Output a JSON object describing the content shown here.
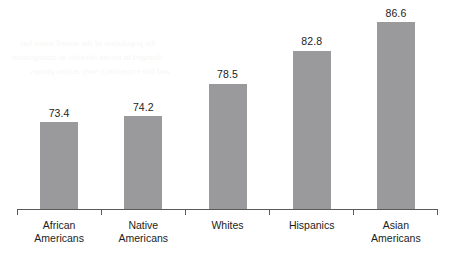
{
  "chart_data": {
    "type": "bar",
    "title": "",
    "title_note": "title cropped off at top edge of image",
    "xlabel": "",
    "ylabel": "",
    "categories": [
      "African Americans",
      "Native Americans",
      "Whites",
      "Hispanics",
      "Asian Americans"
    ],
    "category_lines": [
      [
        "African",
        "Americans"
      ],
      [
        "Native",
        "Americans"
      ],
      [
        "Whites",
        ""
      ],
      [
        "Hispanics",
        ""
      ],
      [
        "Asian",
        "Americans"
      ]
    ],
    "values": [
      73.4,
      74.2,
      78.5,
      82.8,
      86.6
    ],
    "value_labels": [
      "73.4",
      "74.2",
      "78.5",
      "82.8",
      "86.6"
    ],
    "ylim": [
      62,
      89.5
    ],
    "y_axis_visible": false,
    "y_ticks": [],
    "grid": false,
    "legend": false,
    "bar_color": "#9a9a9d",
    "axis_color": "#5a5a5a",
    "text_color": "#1c1c1c",
    "background": "#ffffff"
  },
  "bleed": {
    "lines": [
      "the population of the united states has",
      "changed in recent decades as immigration",
      "and life expectancy vary across groups"
    ]
  }
}
